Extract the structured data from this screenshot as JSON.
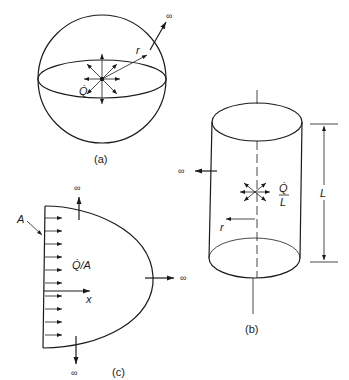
{
  "figure": {
    "panels": [
      {
        "id": "a",
        "caption": "(a)",
        "shape": "sphere",
        "source_label": "Q̇",
        "radius_label": "r",
        "infinity_label": "∞"
      },
      {
        "id": "b",
        "caption": "(b)",
        "shape": "cylinder",
        "source_label_num": "Q̇",
        "source_label_den": "L",
        "radius_label": "r",
        "length_label": "L",
        "infinity_label_left": "∞",
        "infinity_label_lower": "∞"
      },
      {
        "id": "c",
        "caption": "(c)",
        "shape": "plane-source",
        "area_label": "A",
        "flux_label": "Q̇/A",
        "axis_label": "x",
        "infinity_top": "∞",
        "infinity_right": "∞",
        "infinity_bottom": "∞"
      }
    ],
    "colors": {
      "line": "#1a1a1a",
      "background": "#ffffff"
    }
  }
}
